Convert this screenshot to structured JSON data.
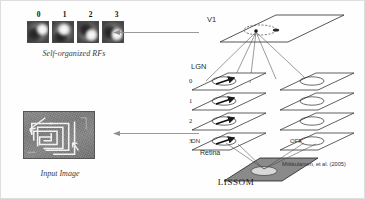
{
  "figure": {
    "left_panel": {
      "rf_caption": "Self-organized RFs",
      "rf_indices": [
        "0",
        "1",
        "2",
        "3"
      ],
      "input_caption": "Input Image",
      "input_icon": "grayscale-photo-with-maze-overlay"
    },
    "connectors": [
      {
        "name": "rf-feedback-arrow",
        "direction": "left",
        "icon": "arrow-left-icon"
      },
      {
        "name": "input-feed-arrow",
        "direction": "left",
        "icon": "arrow-left-icon"
      }
    ],
    "lissom": {
      "title": "LISSOM",
      "v1_label": "V1",
      "lgn_label": "LGN",
      "on_label": "ON",
      "off_label": "OFF",
      "retina_label": "Retina",
      "citation": "Miikkulainen, et al. (2005)",
      "lgn_layer_indices": [
        "0",
        "1",
        "2",
        "3"
      ],
      "v1_neuron_icon": "neuron-dot-icon",
      "v1_receptive_field_icon": "dashed-ellipse-icon",
      "lgn_feature_icon": "oriented-gaussian-icon",
      "retina_icon": "shaded-plane-icon"
    },
    "colors": {
      "stroke": "#2b2b2b",
      "retina_fill": "#8a8a8a",
      "plane_fill": "#ffffff",
      "text": "#2a2a2a"
    }
  }
}
